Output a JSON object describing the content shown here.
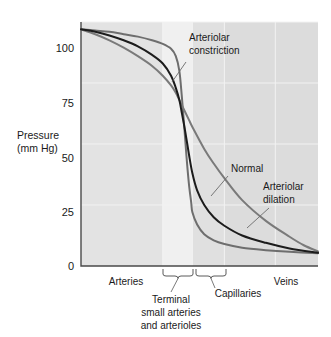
{
  "chart_data": {
    "type": "line",
    "title": "",
    "xlabel": "",
    "ylabel": "Pressure",
    "ylabel_units": "(mm Hg)",
    "ylim": [
      0,
      100
    ],
    "yticks": [
      0,
      25,
      50,
      75,
      100
    ],
    "ytick_labels": [
      "0",
      "25",
      "50",
      "75",
      "100"
    ],
    "grid": true,
    "legend_position": "inline-annotations",
    "x_regions": [
      {
        "name": "arteries",
        "label": "Arteries",
        "x_start": 0.0,
        "x_end": 0.345,
        "shade": "#e3e3e3",
        "bracket": false
      },
      {
        "name": "terminal-small-arteries-and-arterioles",
        "label": "Terminal\nsmall arteries\nand arterioles",
        "x_start": 0.345,
        "x_end": 0.47,
        "shade": "#f0f0f0",
        "bracket": true
      },
      {
        "name": "capillaries",
        "label": "Capillaries",
        "x_start": 0.47,
        "x_end": 0.605,
        "shade": "#e0e0e0",
        "bracket": true
      },
      {
        "name": "veins",
        "label": "Veins",
        "x_start": 0.605,
        "x_end": 1.0,
        "shade": "#dcdcdc",
        "bracket": false
      }
    ],
    "series": [
      {
        "name": "Arteriolar constriction",
        "color": "#6e6e6e",
        "width": 2.0,
        "annotation": "Arteriolar\nconstriction",
        "points": [
          [
            0.0,
            97
          ],
          [
            0.06,
            96.5
          ],
          [
            0.12,
            96
          ],
          [
            0.18,
            95
          ],
          [
            0.24,
            94
          ],
          [
            0.3,
            92.5
          ],
          [
            0.345,
            91
          ],
          [
            0.38,
            89
          ],
          [
            0.4,
            86
          ],
          [
            0.415,
            80
          ],
          [
            0.425,
            70
          ],
          [
            0.435,
            58
          ],
          [
            0.445,
            45
          ],
          [
            0.455,
            34
          ],
          [
            0.465,
            26
          ],
          [
            0.47,
            22
          ],
          [
            0.49,
            17
          ],
          [
            0.52,
            13
          ],
          [
            0.56,
            10.5
          ],
          [
            0.605,
            9
          ],
          [
            0.68,
            7.5
          ],
          [
            0.78,
            6.5
          ],
          [
            0.88,
            5.8
          ],
          [
            1.0,
            5.2
          ]
        ]
      },
      {
        "name": "Normal",
        "color": "#1c1c1c",
        "width": 2.0,
        "annotation": "Normal",
        "points": [
          [
            0.0,
            97
          ],
          [
            0.06,
            96
          ],
          [
            0.12,
            94.5
          ],
          [
            0.18,
            92.5
          ],
          [
            0.24,
            90
          ],
          [
            0.3,
            86.5
          ],
          [
            0.345,
            83
          ],
          [
            0.38,
            78
          ],
          [
            0.4,
            73
          ],
          [
            0.415,
            68
          ],
          [
            0.425,
            63
          ],
          [
            0.44,
            55
          ],
          [
            0.455,
            46
          ],
          [
            0.47,
            38
          ],
          [
            0.49,
            31
          ],
          [
            0.52,
            25
          ],
          [
            0.56,
            20
          ],
          [
            0.605,
            16.5
          ],
          [
            0.68,
            12.5
          ],
          [
            0.78,
            9.5
          ],
          [
            0.88,
            7.2
          ],
          [
            1.0,
            5.4
          ]
        ]
      },
      {
        "name": "Arteriolar dilation",
        "color": "#7a7a7a",
        "width": 2.0,
        "annotation": "Arteriolar\ndilation",
        "points": [
          [
            0.0,
            97
          ],
          [
            0.06,
            95
          ],
          [
            0.12,
            92.5
          ],
          [
            0.18,
            89.5
          ],
          [
            0.24,
            86
          ],
          [
            0.3,
            82
          ],
          [
            0.345,
            78
          ],
          [
            0.38,
            74
          ],
          [
            0.4,
            71
          ],
          [
            0.425,
            66
          ],
          [
            0.455,
            60
          ],
          [
            0.47,
            57
          ],
          [
            0.52,
            48
          ],
          [
            0.56,
            42
          ],
          [
            0.605,
            36
          ],
          [
            0.68,
            27
          ],
          [
            0.78,
            18.5
          ],
          [
            0.88,
            12
          ],
          [
            0.94,
            8.5
          ],
          [
            1.0,
            6.0
          ]
        ]
      }
    ],
    "annotations": [
      {
        "name": "arteriolar-constriction",
        "lines": [
          "Arteriolar",
          "constriction"
        ]
      },
      {
        "name": "normal",
        "lines": [
          "Normal"
        ]
      },
      {
        "name": "arteriolar-dilation",
        "lines": [
          "Arteriolar",
          "dilation"
        ]
      }
    ]
  },
  "axis": {
    "y_title_line1": "Pressure",
    "y_title_line2": "(mm Hg)",
    "ticks": {
      "t100": "100",
      "t75": "75",
      "t50": "50",
      "t25": "25",
      "t0": "0"
    }
  },
  "regions": {
    "arteries": "Arteries",
    "terminal_l1": "Terminal",
    "terminal_l2": "small arteries",
    "terminal_l3": "and arterioles",
    "capillaries": "Capillaries",
    "veins": "Veins"
  },
  "annotations": {
    "constriction_l1": "Arteriolar",
    "constriction_l2": "constriction",
    "normal": "Normal",
    "dilation_l1": "Arteriolar",
    "dilation_l2": "dilation"
  },
  "colors": {
    "curve_normal": "#1c1c1c",
    "curve_constriction": "#6e6e6e",
    "curve_dilation": "#7a7a7a",
    "band_arteries": "#e3e3e3",
    "band_terminal": "#f0f0f0",
    "band_capillaries": "#e0e0e0",
    "band_veins": "#dcdcdc",
    "gridline": "#f2f2f2",
    "axis": "#4a4a4a"
  }
}
